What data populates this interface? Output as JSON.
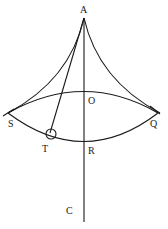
{
  "diagram": {
    "type": "geometric-figure",
    "labels": {
      "A": "A",
      "O": "O",
      "S": "S",
      "Q": "Q",
      "T": "T",
      "R": "R",
      "C": "C"
    },
    "colors": {
      "stroke": "#1a1a1a",
      "background": "#ffffff"
    }
  }
}
